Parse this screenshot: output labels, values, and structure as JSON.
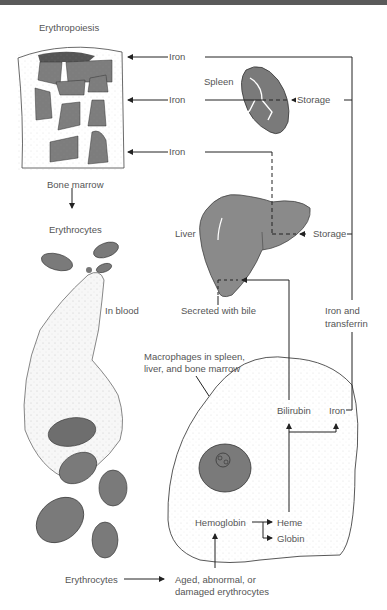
{
  "colors": {
    "organ_fill": "#8a8a8a",
    "line": "#222222",
    "text": "#555555",
    "top_bar": "#5a5a5a"
  },
  "labels": {
    "erythropoiesis": "Erythropoiesis",
    "bone_marrow": "Bone marrow",
    "erythrocytes_top": "Erythrocytes",
    "in_blood": "In blood",
    "spleen": "Spleen",
    "liver": "Liver",
    "iron_1": "Iron",
    "iron_2": "Iron",
    "iron_3": "Iron",
    "storage_spleen": "Storage",
    "storage_liver": "Storage",
    "secreted_with_bile": "Secreted with bile",
    "iron_and_transferrin_1": "Iron and",
    "iron_and_transferrin_2": "transferrin",
    "macrophages_1": "Macrophages in spleen,",
    "macrophages_2": "liver, and bone marrow",
    "bilirubin": "Bilirubin",
    "iron_macrophage": "Iron",
    "hemoglobin": "Hemoglobin",
    "heme": "Heme",
    "globin": "Globin",
    "erythrocytes_bottom": "Erythrocytes",
    "aged_1": "Aged, abnormal, or",
    "aged_2": "damaged erythrocytes"
  }
}
